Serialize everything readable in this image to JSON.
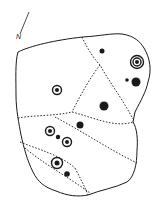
{
  "diagram": {
    "type": "rock-art-plan",
    "north_label": "N",
    "colors": {
      "ink": "#1a1a1a",
      "background": "#ffffff"
    },
    "north_arrow": {
      "x1": 29,
      "y1": 12,
      "x2": 20,
      "y2": 34,
      "label_x": 16,
      "label_y": 33
    },
    "outline": "M18,52 C30,46 55,40 83,37 C100,36 112,33 122,34 C135,36 140,42 144,48 C150,58 152,70 148,82 C146,92 141,100 135,112 L133,122 C137,128 138,140 137,150 C137,165 134,177 127,182 C115,188 100,190 88,195 C78,197 68,196 56,191 C44,187 38,182 33,172 C27,160 24,148 21,135 C19,124 16,110 16,95 C16,80 15,62 18,52 Z",
    "dashed_lines": [
      "M82,37 C88,50 95,60 100,65 C108,80 120,95 133,119",
      "M100,65 C92,75 82,92 72,112",
      "M18,118 C35,115 55,116 72,112",
      "M72,112 C95,118 115,128 133,122",
      "M55,117 C80,130 110,150 137,163",
      "M20,142 C40,150 60,155 75,168",
      "M25,148 C45,165 70,178 90,193",
      "M75,168 C80,178 84,185 88,195"
    ],
    "marks": [
      {
        "kind": "cup",
        "cx": 102,
        "cy": 51,
        "r": 2.5
      },
      {
        "kind": "ring",
        "cx": 137,
        "cy": 62,
        "rings": [
          6.5,
          4
        ],
        "dot": 2
      },
      {
        "kind": "cup",
        "cx": 127,
        "cy": 80,
        "r": 1.8
      },
      {
        "kind": "cup",
        "cx": 136,
        "cy": 82,
        "r": 4.5
      },
      {
        "kind": "ring",
        "cx": 57,
        "cy": 90,
        "rings": [
          4.5
        ],
        "dot": 2
      },
      {
        "kind": "cup",
        "cx": 104,
        "cy": 106,
        "r": 4.5
      },
      {
        "kind": "cup",
        "cx": 80,
        "cy": 125,
        "r": 3.5
      },
      {
        "kind": "ring",
        "cx": 50,
        "cy": 131,
        "rings": [
          4.5
        ],
        "dot": 2
      },
      {
        "kind": "cup",
        "cx": 58,
        "cy": 137,
        "r": 2.2
      },
      {
        "kind": "ring",
        "cx": 67,
        "cy": 142,
        "rings": [
          4.5
        ],
        "dot": 2
      },
      {
        "kind": "ring",
        "cx": 57,
        "cy": 163,
        "rings": [
          5.5
        ],
        "dot": 2.5
      },
      {
        "kind": "cup",
        "cx": 67,
        "cy": 174,
        "r": 2.8
      }
    ]
  }
}
